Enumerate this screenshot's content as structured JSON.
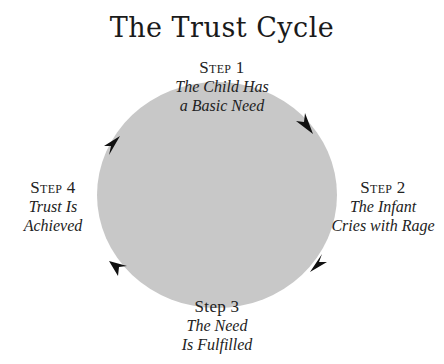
{
  "title": "The Trust Cycle",
  "colors": {
    "circle": "#c8c8c8",
    "arrow": "#111111",
    "text": "#222222"
  },
  "steps": [
    {
      "heading": "Step 1",
      "line1": "The Child Has",
      "line2": "a Basic Need"
    },
    {
      "heading": "Step 2",
      "line1": "The Infant",
      "line2": "Cries with Rage"
    },
    {
      "heading": "Step 3",
      "line1": "The Need",
      "line2": "Is Fulfilled"
    },
    {
      "heading": "Step 4",
      "line1": "Trust Is",
      "line2": "Achieved"
    }
  ],
  "arrows": [
    "arrow-step1-to-step2",
    "arrow-step2-to-step3",
    "arrow-step3-to-step4",
    "arrow-step4-to-step1"
  ]
}
